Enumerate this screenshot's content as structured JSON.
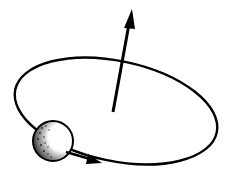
{
  "diagram": {
    "kind": "orbit-angular-momentum",
    "elements": {
      "orbit": {
        "shape": "ellipse",
        "cx": 116,
        "cy": 111,
        "rx": 103,
        "ry": 50,
        "rotation_deg": 12,
        "stroke": "#000000"
      },
      "vector": {
        "from": [
          113,
          111
        ],
        "to": [
          131,
          10
        ],
        "label": "",
        "stroke": "#000000"
      },
      "body": {
        "cx": 53,
        "cy": 141,
        "r": 20,
        "fill": "#ffffff",
        "shaded_side": "left"
      },
      "direction_arrow": {
        "at": [
          97,
          160
        ],
        "direction": "clockwise-forward"
      }
    },
    "colors": {
      "ink": "#000000",
      "background": "#ffffff"
    }
  }
}
